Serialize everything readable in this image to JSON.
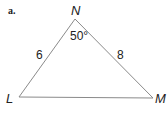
{
  "part_label": "a.",
  "triangle": {
    "vertices": {
      "top": "N",
      "left": "L",
      "right": "M"
    },
    "sides": {
      "LN": "6",
      "NM": "8"
    },
    "angle_N": "50°"
  },
  "colors": {
    "stroke": "#8a8a8a",
    "text": "#222222"
  }
}
